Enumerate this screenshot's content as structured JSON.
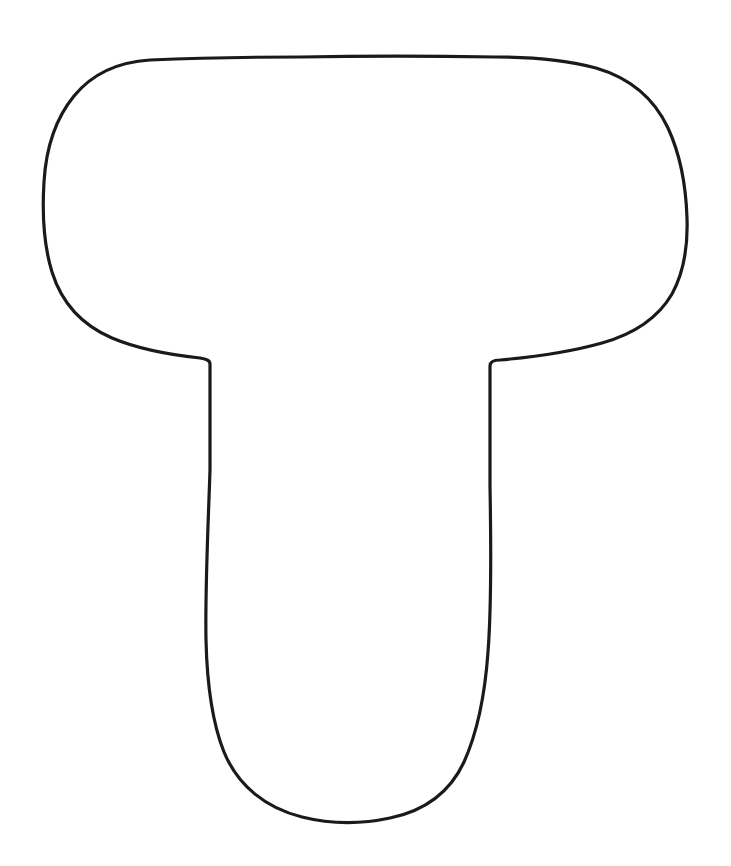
{
  "page": {
    "background_color": "#ffffff",
    "width": 731,
    "height": 866
  },
  "artwork": {
    "name": "uppercase-letter-t-outline",
    "description": "Hand-drawn outline of the capital letter T, a printable coloring / craft template",
    "glyph": "T",
    "style": "outline-only, no fill, rounded corners, slightly irregular hand-drawn contour",
    "stroke_color": "#1a1a1a",
    "fill_color": "#ffffff",
    "stroke_width": 3.2,
    "bounding_box": {
      "left": 43,
      "top": 55,
      "right": 688,
      "bottom": 823
    },
    "path": "M 150 60 C 118 62 92 74 74 96 C 56 118 46 148 44 182 C 42 214 44 246 52 272 C 62 304 84 326 112 338 C 138 349 172 355 200 358 C 206 359 210 360 210 364 L 210 470 C 208 530 205 590 206 640 C 207 684 212 722 224 752 C 238 786 266 808 302 817 C 330 824 362 824 390 818 C 424 811 450 792 464 762 C 478 731 485 694 488 652 C 492 600 491 540 490 486 L 490 366 C 490 362 493 360 500 360 C 534 357 570 352 602 343 C 634 334 658 318 672 294 C 684 272 688 246 687 218 C 686 186 680 154 668 128 C 654 98 630 78 596 68 C 566 60 532 57 496 57 C 430 56 360 56 300 57 C 248 57 196 58 150 60 Z"
  }
}
